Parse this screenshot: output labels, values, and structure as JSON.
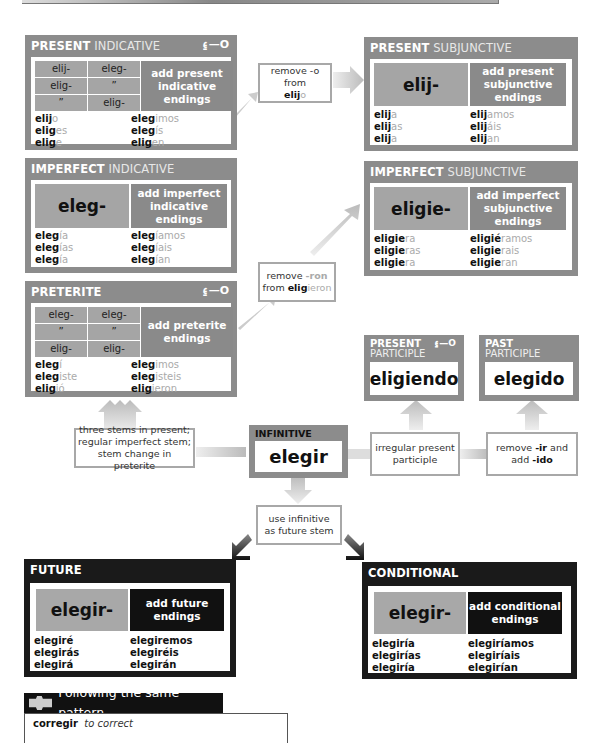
{
  "present_indicative": {
    "title_bold": "PRESENT",
    "title_light": "INDICATIVE",
    "key_icon": "key-icon",
    "stems": [
      "elij-",
      "eleg-",
      "elig-",
      "”",
      "”",
      "elig-"
    ],
    "endings_label": "add present indicative endings",
    "forms_left": [
      {
        "stem": "elij",
        "ending": "o"
      },
      {
        "stem": "elig",
        "ending": "es"
      },
      {
        "stem": "elig",
        "ending": "e"
      }
    ],
    "forms_right": [
      {
        "stem": "eleg",
        "ending": "imos"
      },
      {
        "stem": "eleg",
        "ending": "ís"
      },
      {
        "stem": "elig",
        "ending": "en"
      }
    ]
  },
  "note_remove_o": {
    "line1": "remove -o from",
    "stem": "elij",
    "ending": "o"
  },
  "present_subjunctive": {
    "title_bold": "PRESENT",
    "title_light": "SUBJUNCTIVE",
    "stem": "elij-",
    "endings_label": "add present subjunctive endings",
    "forms_left": [
      {
        "stem": "elij",
        "ending": "a"
      },
      {
        "stem": "elij",
        "ending": "as"
      },
      {
        "stem": "elij",
        "ending": "a"
      }
    ],
    "forms_right": [
      {
        "stem": "elij",
        "ending": "amos"
      },
      {
        "stem": "elij",
        "ending": "áis"
      },
      {
        "stem": "elij",
        "ending": "an"
      }
    ]
  },
  "imperfect_indicative": {
    "title_bold": "IMPERFECT",
    "title_light": "INDICATIVE",
    "stem": "eleg-",
    "endings_label": "add imperfect indicative endings",
    "forms_left": [
      {
        "stem": "eleg",
        "ending": "ía"
      },
      {
        "stem": "eleg",
        "ending": "ías"
      },
      {
        "stem": "eleg",
        "ending": "ía"
      }
    ],
    "forms_right": [
      {
        "stem": "eleg",
        "ending": "íamos"
      },
      {
        "stem": "eleg",
        "ending": "íais"
      },
      {
        "stem": "eleg",
        "ending": "ían"
      }
    ]
  },
  "imperfect_subjunctive": {
    "title_bold": "IMPERFECT",
    "title_light": "SUBJUNCTIVE",
    "stem": "eligie-",
    "endings_label": "add imperfect subjunctive endings",
    "forms_left": [
      {
        "stem": "eligie",
        "ending": "ra"
      },
      {
        "stem": "eligie",
        "ending": "ras"
      },
      {
        "stem": "eligie",
        "ending": "ra"
      }
    ],
    "forms_right": [
      {
        "stem": "eligié",
        "ending": "ramos"
      },
      {
        "stem": "eligie",
        "ending": "rais"
      },
      {
        "stem": "eligie",
        "ending": "ran"
      }
    ]
  },
  "note_remove_ron": {
    "line1_a": "remove ",
    "line1_b": "-ron",
    "line2_a": "from ",
    "stem": "elig",
    "ending": "ieron"
  },
  "preterite": {
    "title_bold": "PRETERITE",
    "key_icon": "key-icon",
    "stems": [
      "eleg-",
      "eleg-",
      "”",
      "”",
      "elig-",
      "elig-"
    ],
    "endings_label": "add preterite endings",
    "forms_left": [
      {
        "stem": "eleg",
        "ending": "í"
      },
      {
        "stem": "eleg",
        "ending": "iste"
      },
      {
        "stem": "elig",
        "ending": "ió"
      }
    ],
    "forms_right": [
      {
        "stem": "eleg",
        "ending": "imos"
      },
      {
        "stem": "eleg",
        "ending": "isteis"
      },
      {
        "stem": "elig",
        "ending": "ieron"
      }
    ]
  },
  "present_participle": {
    "title_bold": "PRESENT",
    "title_light": "PARTICIPLE",
    "value": "eligiendo"
  },
  "past_participle": {
    "title_bold": "PAST",
    "title_light": "PARTICIPLE",
    "value": "elegido"
  },
  "infinitive": {
    "title": "INFINITIVE",
    "value": "elegir"
  },
  "note_stems": {
    "lines": [
      "three stems in present;",
      "regular imperfect stem;",
      "stem change in preterite"
    ]
  },
  "note_irregular": {
    "lines": [
      "irregular present",
      "participle"
    ]
  },
  "note_ido": {
    "a": "remove ",
    "b": "-ir",
    "c": " and",
    "d": "add ",
    "e": "-ido"
  },
  "note_future": {
    "lines": [
      "use infinitive",
      "as future stem"
    ]
  },
  "future": {
    "title": "FUTURE",
    "stem": "elegir-",
    "endings_label": "add future endings",
    "forms_left": [
      "elegiré",
      "elegirás",
      "elegirá"
    ],
    "forms_right": [
      "elegiremos",
      "elegiréis",
      "elegirán"
    ]
  },
  "conditional": {
    "title": "CONDITIONAL",
    "stem": "elegir-",
    "endings_label": "add conditional endings",
    "forms_left": [
      "elegiría",
      "elegirías",
      "elegiría"
    ],
    "forms_right": [
      "elegiríamos",
      "elegiríais",
      "elegirían"
    ]
  },
  "pattern": {
    "icon": "puzzle-icon",
    "heading": "Following the same pattern",
    "verb": "corregir",
    "meaning": "to correct"
  },
  "colors": {
    "panel_gray": "#8c8c8c",
    "stem_gray": "#a5a5a5",
    "panel_dark": "#1a1a1a",
    "ending_gray": "#aaaaaa"
  }
}
